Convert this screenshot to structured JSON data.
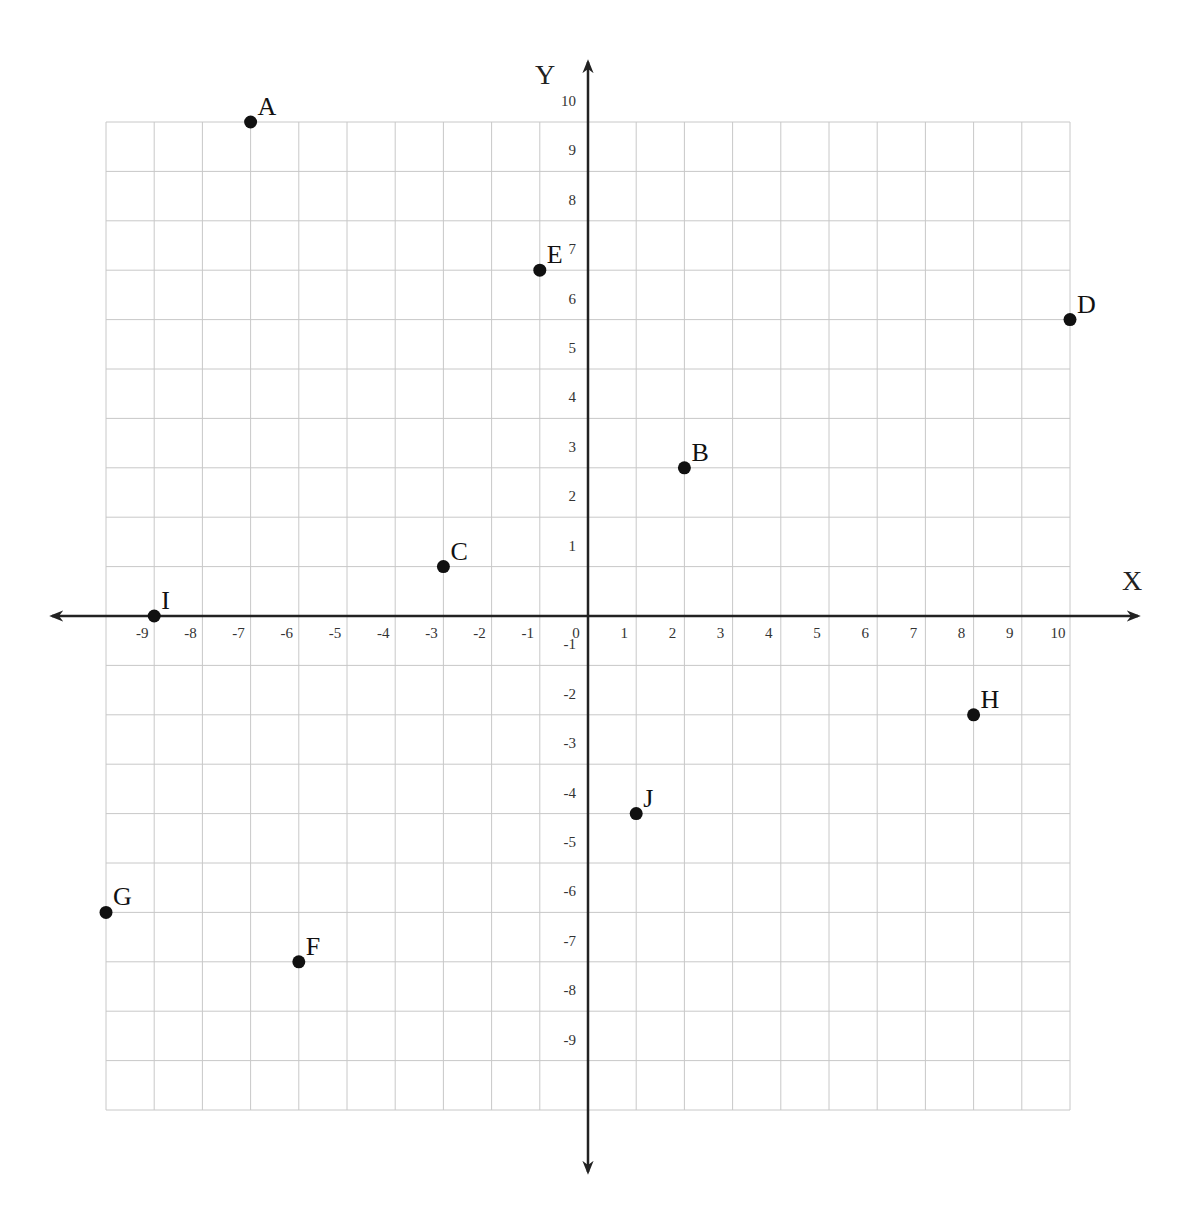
{
  "chart_data": {
    "type": "scatter",
    "title": "",
    "xlabel": "X",
    "ylabel": "Y",
    "xlim": [
      -10,
      10
    ],
    "ylim": [
      -10,
      10
    ],
    "grid": true,
    "legend": null,
    "x_ticks": [
      "-9",
      "-8",
      "-7",
      "-6",
      "-5",
      "-4",
      "-3",
      "-2",
      "-1",
      "0",
      "1",
      "2",
      "3",
      "4",
      "5",
      "6",
      "7",
      "8",
      "9",
      "10"
    ],
    "y_ticks": [
      "10",
      "9",
      "8",
      "7",
      "6",
      "5",
      "4",
      "3",
      "2",
      "1",
      "-1",
      "-2",
      "-3",
      "-4",
      "-5",
      "-6",
      "-7",
      "-8",
      "-9"
    ],
    "points": [
      {
        "label": "A",
        "x": -7,
        "y": 10
      },
      {
        "label": "B",
        "x": 2,
        "y": 3
      },
      {
        "label": "C",
        "x": -3,
        "y": 1
      },
      {
        "label": "D",
        "x": 10,
        "y": 6
      },
      {
        "label": "E",
        "x": -1,
        "y": 7
      },
      {
        "label": "F",
        "x": -6,
        "y": -7
      },
      {
        "label": "G",
        "x": -10,
        "y": -6
      },
      {
        "label": "H",
        "x": 8,
        "y": -2
      },
      {
        "label": "I",
        "x": -9,
        "y": 0
      },
      {
        "label": "J",
        "x": 1,
        "y": -4
      }
    ]
  },
  "colors": {
    "grid": "#c8c8c8",
    "axis": "#222222",
    "point": "#111111",
    "background": "#ffffff"
  }
}
